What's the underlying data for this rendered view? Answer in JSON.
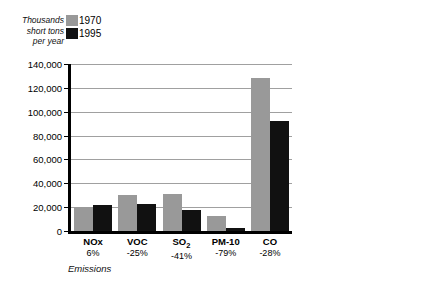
{
  "chart_data": {
    "type": "bar",
    "title": "",
    "panels": [
      {
        "name": "main",
        "ylabel": "Thousands\nshort tons\nper year",
        "xlabel": "Emissions",
        "ylim": [
          0,
          140000
        ],
        "ytick_step": 20000,
        "ytick_labels": [
          "140,000",
          "120,000",
          "100,000",
          "80,000",
          "60,000",
          "40,000",
          "20,000",
          "0"
        ],
        "ytick_values": [
          140000,
          120000,
          100000,
          80000,
          60000,
          40000,
          20000,
          0
        ],
        "grid": true,
        "categories": [
          "NOx",
          "VOC",
          "SO2",
          "PM-10",
          "CO"
        ],
        "category_labels": [
          "NOx",
          "VOC",
          "SO₂",
          "PM-10",
          "CO"
        ],
        "category_changes": [
          "6%",
          "-25%",
          "-41%",
          "-79%",
          "-28%"
        ],
        "series": [
          {
            "name": "1970",
            "color": "#999999",
            "values": [
              20500,
              30500,
              31000,
              13000,
              128000
            ]
          },
          {
            "name": "1995",
            "color": "#111111",
            "values": [
              21500,
              22500,
              18000,
              2800,
              92000
            ]
          }
        ]
      },
      {
        "name": "side",
        "ylabel": "Short tons\nper year",
        "xlabel": "",
        "ylim": [
          0,
          250000
        ],
        "ytick_step": 50000,
        "ytick_labels": [
          "250,000",
          "200,000",
          "150,000",
          "100,000",
          "50,000",
          "0"
        ],
        "ytick_values": [
          250000,
          200000,
          150000,
          100000,
          50000,
          0
        ],
        "grid": true,
        "categories": [
          "Pb"
        ],
        "category_labels": [
          "Pb"
        ],
        "category_changes": [
          "-98%"
        ],
        "series": [
          {
            "name": "1970",
            "color": "#999999",
            "values": [
              219000
            ]
          },
          {
            "name": "1995",
            "color": "#111111",
            "values": [
              5000
            ]
          }
        ]
      }
    ],
    "legend": {
      "position": "top-left",
      "entries": [
        {
          "label": "1970",
          "color": "#999999"
        },
        {
          "label": "1995",
          "color": "#111111"
        }
      ]
    }
  },
  "colors": {
    "series_1970": "#999999",
    "series_1995": "#111111",
    "gridline": "#a0a0a0",
    "axis": "#000000",
    "background": "#ffffff"
  }
}
